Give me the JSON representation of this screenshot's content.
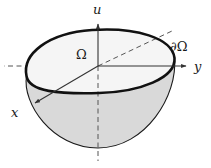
{
  "figure": {
    "name": "paraboloid-over-domain-diagram",
    "background_color": "#ffffff",
    "width": 211,
    "height": 168,
    "labels": {
      "u_axis": "u",
      "y_axis": "y",
      "x_axis": "x",
      "domain": "Ω",
      "boundary_partial": "∂",
      "boundary_omega": "Ω",
      "boundary_full": "∂Ω"
    },
    "colors": {
      "stroke_dark": "#1a1a1a",
      "outline_thick": "#111111",
      "axis_solid": "#333333",
      "axis_dashed": "#555555",
      "top_face_fill": "#f7f7f7",
      "bowl_fill": "#d9d9d9",
      "label_text": "#1a1a1a"
    },
    "geometry": {
      "origin": {
        "x": 98,
        "y": 66
      },
      "u_axis": {
        "kind": "vertical",
        "solid_from": {
          "x": 98,
          "y": 66
        },
        "solid_to": {
          "x": 98,
          "y": 22
        },
        "dashed_from": {
          "x": 98,
          "y": 66
        },
        "dashed_to": {
          "x": 98,
          "y": 161
        },
        "arrow": "up"
      },
      "y_axis": {
        "kind": "horizontal",
        "solid_from": {
          "x": 98,
          "y": 66
        },
        "solid_to": {
          "x": 189,
          "y": 66
        },
        "dashed_from": {
          "x": 98,
          "y": 66
        },
        "dashed_to": {
          "x": 4,
          "y": 66
        },
        "arrow": "right"
      },
      "x_axis": {
        "kind": "diagonal",
        "solid_from": {
          "x": 98,
          "y": 66
        },
        "solid_to": {
          "x": 33,
          "y": 104
        },
        "dashed_from": {
          "x": 98,
          "y": 66
        },
        "dashed_to": {
          "x": 172,
          "y": 31
        },
        "arrow": "down-left"
      },
      "domain_ellipse": {
        "description": "tilted closed curve = boundary of Ω lifted to u=0 plane",
        "center": {
          "x": 99,
          "y": 62
        },
        "rx": 77,
        "ry": 36,
        "rotation_deg": -13
      },
      "paraboloid_bowl": {
        "description": "surface u = -(x^2+y^2) below Ω, lowest point at center",
        "apex": {
          "x": 98,
          "y": 148
        },
        "left_rim": {
          "x": 26,
          "y": 76
        },
        "right_rim": {
          "x": 174,
          "y": 58
        }
      }
    }
  }
}
